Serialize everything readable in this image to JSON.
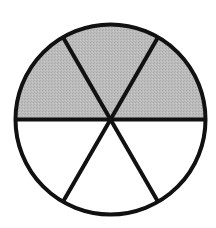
{
  "diagram": {
    "type": "fraction-circle",
    "total_parts": 6,
    "shaded_parts": 3,
    "shaded_sectors": [
      0,
      1,
      2
    ],
    "geometry": {
      "center_x": 110.5,
      "center_y": 119.5,
      "radius": 95,
      "stroke_width": 4,
      "start_angle_deg": 180,
      "sector_angle_deg": 60
    },
    "colors": {
      "background": "#ffffff",
      "shaded_fill": "#b9b9b9",
      "unshaded_fill": "#ffffff",
      "stroke": "#111111"
    }
  }
}
